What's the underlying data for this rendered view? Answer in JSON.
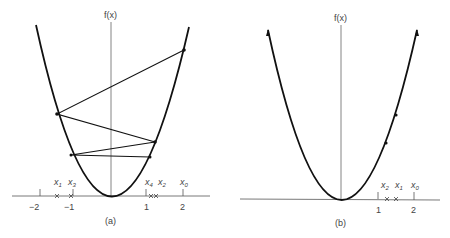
{
  "panel_a": {
    "caption": "(a)",
    "y_axis_label": "f(x)",
    "ticks": [
      "−2",
      "−1",
      "1",
      "2"
    ],
    "iterates": [
      {
        "label": "x",
        "sub": "0"
      },
      {
        "label": "x",
        "sub": "1"
      },
      {
        "label": "x",
        "sub": "2"
      },
      {
        "label": "x",
        "sub": "3"
      },
      {
        "label": "x",
        "sub": "4"
      }
    ]
  },
  "panel_b": {
    "caption": "(b)",
    "y_axis_label": "f(x)",
    "ticks": [
      "1",
      "2"
    ],
    "iterates": [
      {
        "label": "x",
        "sub": "2"
      },
      {
        "label": "x",
        "sub": "1"
      },
      {
        "label": "x",
        "sub": "0"
      }
    ]
  },
  "colors": {
    "curve": "#111111",
    "axis": "#555555",
    "text": "#444444"
  }
}
